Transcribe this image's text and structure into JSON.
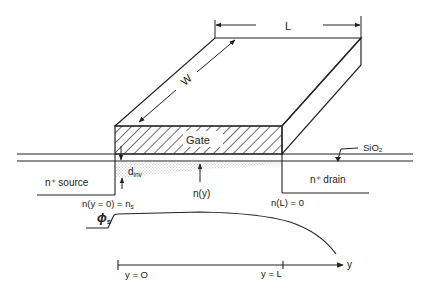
{
  "figure": {
    "colors": {
      "ink": "#222222",
      "background": "#ffffff",
      "hatch": "#222222",
      "stipple": "#8a8a8a"
    }
  },
  "labels": {
    "length": "L",
    "width": "W",
    "gate": "Gate",
    "oxide": "SiO₂",
    "source": "n⁺ source",
    "drain": "n⁺ drain",
    "d_inv": "d",
    "d_inv_sub": "inv",
    "n_y": "n(y)",
    "n_source": "n(y = 0) = n",
    "n_source_sub": "s",
    "n_drain": "n(L) = 0",
    "phi": "ϕ",
    "phi_sub": "s",
    "y0": "y = O",
    "yL": "y = L",
    "y_axis": "y"
  }
}
